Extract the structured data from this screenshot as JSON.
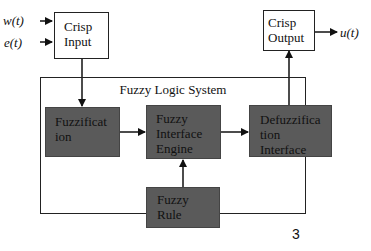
{
  "inputs": [
    {
      "label": "w(t)"
    },
    {
      "label": "e(t)"
    }
  ],
  "crisp_input": {
    "line1": "Crisp",
    "line2": "Input"
  },
  "crisp_output": {
    "line1": "Crisp",
    "line2": "Output"
  },
  "output_signal": {
    "label": "u(t)"
  },
  "system": {
    "title": "Fuzzy Logic System",
    "blocks": {
      "fuzzification": {
        "line1": "Fuzzificat",
        "line2": "ion"
      },
      "inference": {
        "line1": "Fuzzy",
        "line2": "Interface",
        "line3": "Engine"
      },
      "defuzzification": {
        "line1": "Defuzzifica",
        "line2": "tion",
        "line3": "Interface"
      },
      "rule": {
        "line1": "Fuzzy",
        "line2": "Rule"
      }
    }
  },
  "page_number": "3",
  "colors": {
    "block_fill": "#5a5a5a",
    "line": "#222222",
    "background": "#ffffff"
  }
}
